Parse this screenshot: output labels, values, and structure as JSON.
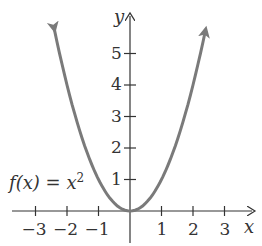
{
  "chart_data": {
    "type": "line",
    "title": "",
    "function_label": "f(x) = x²",
    "function_label_parts": {
      "lhs": "f(x) = x",
      "exp": "2"
    },
    "xlabel": "x",
    "ylabel": "y",
    "x_ticks": [
      -3,
      -2,
      -1,
      1,
      2,
      3
    ],
    "x_tick_labels": [
      "−3",
      "−2",
      "−1",
      "1",
      "2",
      "3"
    ],
    "y_ticks": [
      1,
      2,
      3,
      4,
      5
    ],
    "y_tick_labels": [
      "1",
      "2",
      "3",
      "4",
      "5"
    ],
    "xlim": [
      -3.5,
      3.5
    ],
    "ylim": [
      -0.6,
      6
    ],
    "grid": false,
    "series": [
      {
        "name": "f(x) = x^2",
        "color": "#7a7a7a",
        "x": [
          -2.4,
          -2,
          -1.5,
          -1,
          -0.5,
          0,
          0.5,
          1,
          1.5,
          2,
          2.4
        ],
        "y": [
          5.76,
          4,
          2.25,
          1,
          0.25,
          0,
          0.25,
          1,
          2.25,
          4,
          5.76
        ]
      }
    ]
  }
}
